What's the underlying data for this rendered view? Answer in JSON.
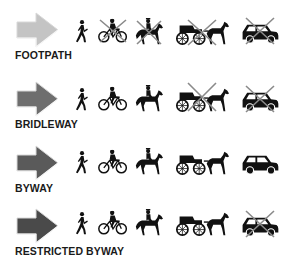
{
  "legend": {
    "rows": [
      {
        "label": "FOOTPATH",
        "arrow_color": "#c4c4c4",
        "allowed": {
          "walker": true,
          "cyclist": false,
          "horse_rider": false,
          "horse_carriage": false,
          "motor_vehicle": false
        }
      },
      {
        "label": "BRIDLEWAY",
        "arrow_color": "#6e6e6e",
        "allowed": {
          "walker": true,
          "cyclist": true,
          "horse_rider": true,
          "horse_carriage": false,
          "motor_vehicle": false
        }
      },
      {
        "label": "BYWAY",
        "arrow_color": "#5a5a5a",
        "allowed": {
          "walker": true,
          "cyclist": true,
          "horse_rider": true,
          "horse_carriage": true,
          "motor_vehicle": true
        }
      },
      {
        "label": "RESTRICTED BYWAY",
        "arrow_color": "#4a4a4a",
        "allowed": {
          "walker": true,
          "cyclist": true,
          "horse_rider": true,
          "horse_carriage": true,
          "motor_vehicle": false
        }
      }
    ],
    "icons": [
      "walker-icon",
      "cyclist-icon",
      "horse-rider-icon",
      "horse-carriage-icon",
      "motor-vehicle-icon"
    ],
    "cross_color": "#8a8a8a"
  }
}
